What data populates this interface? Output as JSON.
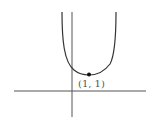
{
  "figure": {
    "type": "function-graph",
    "point_label": "(1, 1)",
    "colors": {
      "axis": "#555555",
      "curve": "#333333",
      "point": "#111111",
      "label": "#555555"
    }
  }
}
